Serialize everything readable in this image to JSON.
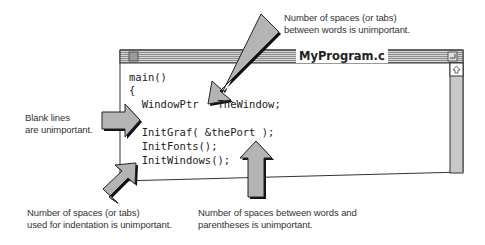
{
  "window": {
    "title": "MyProgram.c",
    "code_lines": [
      "main()",
      "{",
      "  WindowPtr   TheWindow;",
      "",
      "  InitGraf( &thePort );",
      "  InitFonts();",
      "  InitWindows();"
    ]
  },
  "callouts": {
    "top_right": [
      "Number of spaces (or tabs)",
      "between words is unimportant."
    ],
    "left": [
      "Blank lines",
      "are unimportant."
    ],
    "bottom_left": [
      "Number of spaces (or tabs)",
      "used for indentation is unimportant."
    ],
    "bottom_right": [
      "Number of spaces between words and",
      "parentheses is unimportant."
    ]
  },
  "colors": {
    "arrow_fill": "#b4b4b4",
    "arrow_shadow": "#111111",
    "titlebar_stripe": "#9a9a9a",
    "scrollbar": "#c8c8c8"
  }
}
